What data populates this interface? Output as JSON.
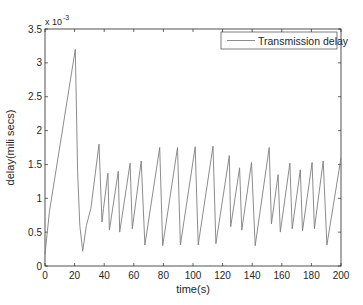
{
  "chart_data": {
    "type": "line",
    "title": "",
    "xlabel": "time(s)",
    "ylabel": "delay(mili secs)",
    "y_multiplier_label": "x 10",
    "y_multiplier_exponent": "-3",
    "xlim": [
      0,
      200
    ],
    "ylim": [
      0,
      3.5
    ],
    "y_scale": 0.001,
    "xticks": [
      0,
      20,
      40,
      60,
      80,
      100,
      120,
      140,
      160,
      180,
      200
    ],
    "xtick_labels": [
      "0",
      "20",
      "40",
      "60",
      "80",
      "100",
      "120",
      "140",
      "160",
      "180",
      "200"
    ],
    "yticks": [
      0,
      0.5,
      1,
      1.5,
      2,
      2.5,
      3,
      3.5
    ],
    "ytick_labels": [
      "0",
      "0.5",
      "1",
      "1.5",
      "2",
      "2.5",
      "3",
      "3.5"
    ],
    "grid": false,
    "legend_position": "upper right",
    "series": [
      {
        "name": "Transmission delay",
        "color": "#7f7f7f",
        "x": [
          0,
          3,
          20.5,
          22,
          23.5,
          25.5,
          28,
          31,
          36.5,
          38.5,
          39.5,
          42.5,
          43.5,
          49.5,
          50.5,
          57.5,
          59,
          65,
          67.5,
          77.5,
          79.5,
          89.5,
          91.5,
          101.5,
          103.5,
          113.5,
          115.5,
          124.5,
          125.5,
          131.5,
          133,
          139.5,
          142,
          151.5,
          153,
          157.5,
          159,
          165.5,
          167,
          172.5,
          174,
          180.5,
          182,
          188,
          190.5,
          200
        ],
        "values": [
          0.17,
          0.8,
          3.2,
          1.4,
          0.6,
          0.22,
          0.6,
          0.85,
          1.8,
          0.65,
          0.85,
          1.37,
          0.53,
          1.4,
          0.5,
          1.52,
          0.55,
          1.55,
          0.31,
          1.75,
          0.3,
          1.75,
          0.31,
          1.76,
          0.31,
          1.77,
          0.33,
          1.63,
          0.58,
          1.45,
          0.53,
          1.53,
          0.3,
          1.75,
          0.62,
          1.35,
          0.5,
          1.52,
          0.55,
          1.42,
          0.52,
          1.53,
          0.55,
          1.55,
          0.31,
          1.6
        ]
      }
    ]
  },
  "legend": {
    "items": [
      {
        "label": "Transmission delay",
        "color": "#7f7f7f"
      }
    ]
  }
}
